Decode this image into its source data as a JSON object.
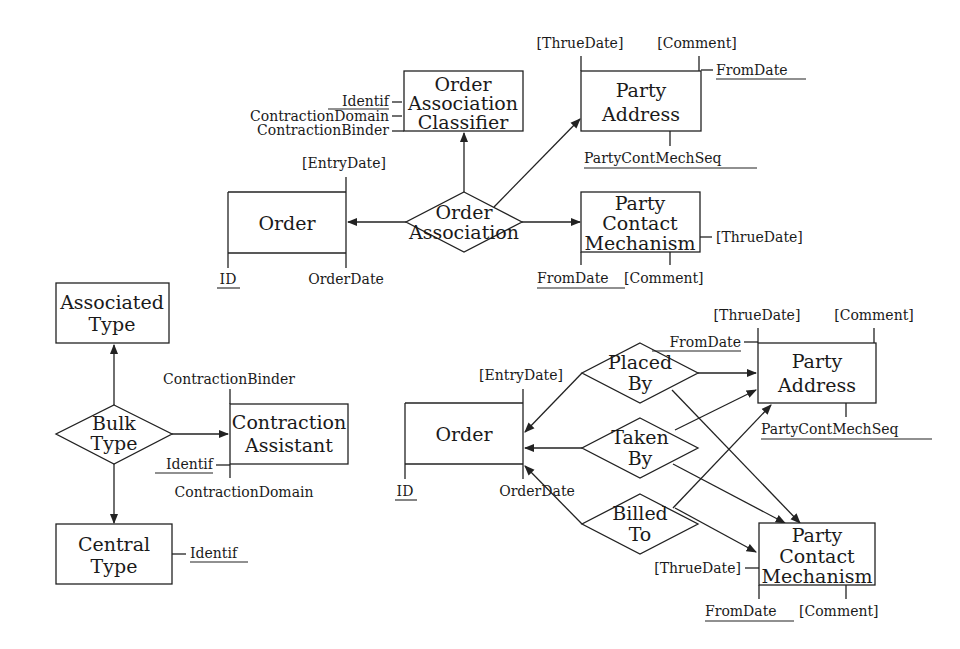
{
  "diagram": {
    "type": "entity-relationship",
    "top": {
      "entities": {
        "order_association_classifier": {
          "line1": "Order",
          "line2": "Association",
          "line3": "Classifier"
        },
        "party_address": {
          "line1": "Party",
          "line2": "Address"
        },
        "order": {
          "label": "Order"
        },
        "party_contact_mechanism": {
          "line1": "Party",
          "line2": "Contact",
          "line3": "Mechanism"
        }
      },
      "relationships": {
        "order_association": {
          "line1": "Order",
          "line2": "Association"
        }
      },
      "attributes": {
        "classifier_identif": "Identif",
        "classifier_contraction_domain": "ContractionDomain",
        "classifier_contraction_binder": "ContractionBinder",
        "pa_thrue_date": "[ThrueDate]",
        "pa_comment": "[Comment]",
        "pa_from_date": "FromDate",
        "pa_party_cont_mech_seq": "PartyContMechSeq",
        "order_entry_date": "[EntryDate]",
        "order_id": "ID",
        "order_order_date": "OrderDate",
        "pcm_thrue_date": "[ThrueDate]",
        "pcm_from_date": "FromDate",
        "pcm_comment": "[Comment]"
      }
    },
    "left": {
      "entities": {
        "associated_type": {
          "line1": "Associated",
          "line2": "Type"
        },
        "contraction_assistant": {
          "line1": "Contraction",
          "line2": "Assistant"
        },
        "central_type": {
          "line1": "Central",
          "line2": "Type"
        }
      },
      "relationships": {
        "bulk_type": {
          "line1": "Bulk",
          "line2": "Type"
        }
      },
      "attributes": {
        "ca_contraction_binder": "ContractionBinder",
        "ca_identif": "Identif",
        "ca_contraction_domain": "ContractionDomain",
        "ct_identif": "Identif"
      }
    },
    "bottom": {
      "entities": {
        "order": {
          "label": "Order"
        },
        "party_address": {
          "line1": "Party",
          "line2": "Address"
        },
        "party_contact_mechanism": {
          "line1": "Party",
          "line2": "Contact",
          "line3": "Mechanism"
        }
      },
      "relationships": {
        "placed_by": {
          "line1": "Placed",
          "line2": "By"
        },
        "taken_by": {
          "line1": "Taken",
          "line2": "By"
        },
        "billed_to": {
          "line1": "Billed",
          "line2": "To"
        }
      },
      "attributes": {
        "order_entry_date": "[EntryDate]",
        "order_id": "ID",
        "order_order_date": "OrderDate",
        "pa_thrue_date": "[ThrueDate]",
        "pa_comment": "[Comment]",
        "pa_from_date": "FromDate",
        "pa_party_cont_mech_seq": "PartyContMechSeq",
        "pcm_thrue_date": "[ThrueDate]",
        "pcm_from_date": "FromDate",
        "pcm_comment": "[Comment]"
      }
    }
  }
}
